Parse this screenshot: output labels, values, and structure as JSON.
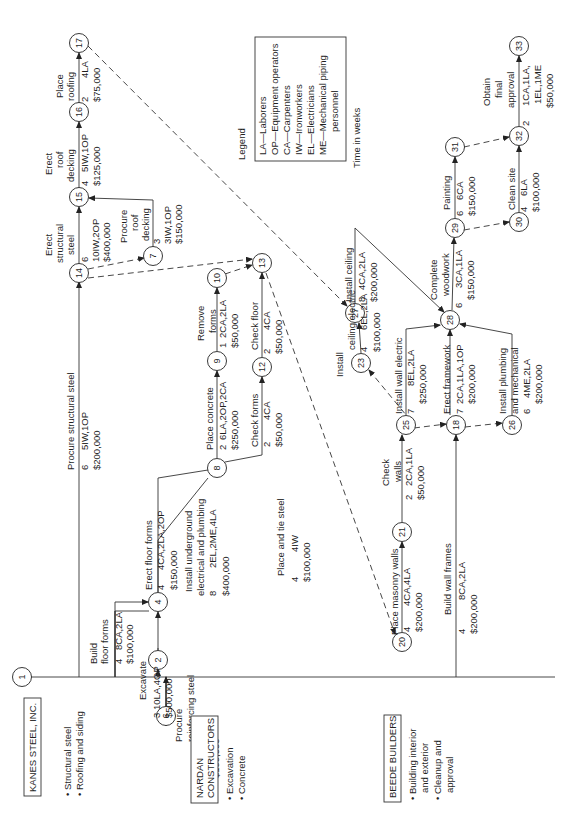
{
  "legend": {
    "title": "Legend",
    "items": [
      "LA—Laborers",
      "OP—Equipment operators",
      "CA—Carpenters",
      "IW—Ironworkers",
      "EL—Electricians",
      "ME—Mechanical piping",
      "personnel"
    ],
    "time_note": "Time in weeks"
  },
  "contractors": [
    {
      "name": "KANES STEEL, INC.",
      "scope": [
        "• Structural steel",
        "• Roofing and siding"
      ]
    },
    {
      "name": "NARDAN",
      "name2": "CONSTRUCTORS",
      "scope": [
        "• Excavation",
        "• Concrete"
      ]
    },
    {
      "name": "BEEDE BUILDERS",
      "scope": [
        "• Building interior",
        "and exterior",
        "• Cleanup and",
        "approval"
      ]
    }
  ],
  "nodes": [
    "1",
    "2",
    "4",
    "6",
    "7",
    "8",
    "9",
    "10",
    "12",
    "13",
    "14",
    "15",
    "16",
    "17",
    "18",
    "20",
    "21",
    "23",
    "25",
    "26",
    "27",
    "28",
    "29",
    "30",
    "31",
    "32",
    "33"
  ],
  "activities": {
    "procure_structural_steel": {
      "name": "Procure structural steel",
      "duration": "6",
      "resources": "5IW,1OP",
      "cost": "$200,000"
    },
    "erect_structural_steel": {
      "name1": "Erect",
      "name2": "structural",
      "name3": "steel",
      "duration": "6",
      "resources": "10IW,2OP",
      "cost": "$400,000"
    },
    "procure_roof_decking": {
      "name1": "Procure",
      "name2": "roof",
      "name3": "decking",
      "duration": "3",
      "resources": "3IW,1OP",
      "cost": "$150,000"
    },
    "erect_roof_decking": {
      "name1": "Erect",
      "name2": "roof",
      "name3": "decking",
      "duration": "4",
      "resources": "5IW,1OP",
      "cost": "$125,000"
    },
    "place_roofing": {
      "name1": "Place",
      "name2": "roofing",
      "duration": "2",
      "resources": "4LA",
      "cost": "$75,000"
    },
    "build_floor_forms": {
      "name1": "Build",
      "name2": "floor forms",
      "duration": "4",
      "resources": "8CA,2LA",
      "cost": "$100,000"
    },
    "excavate": {
      "name": "Excavate",
      "duration": "3",
      "resources": "10LA,4OP",
      "cost": "$500,000"
    },
    "procure_reinforcing_steel": {
      "name1": "Procure",
      "name2": "reinforcing steel",
      "duration": "3",
      "resources": "2IW",
      "cost": "$100,000"
    },
    "erect_floor_forms": {
      "name": "Erect floor forms",
      "duration": "4",
      "resources": "4CA,2LA,2OP",
      "cost": "$150,000"
    },
    "install_underground": {
      "name1": "Install underground",
      "name2": "electrical and plumbing",
      "duration": "8",
      "resources": "2EL,2ME,4LA",
      "cost": "$400,000"
    },
    "place_and_tie_steel": {
      "name": "Place and tie steel",
      "duration": "4",
      "resources": "4IW",
      "cost": "$100,000"
    },
    "place_concrete": {
      "name": "Place concrete",
      "duration": "2",
      "resources": "6LA,2OP,2CA",
      "cost": "$250,000"
    },
    "remove_forms": {
      "name1": "Remove",
      "name2": "forms",
      "duration": "1",
      "resources": "2CA,2LA",
      "cost": "$50,000"
    },
    "check_forms": {
      "name": "Check forms",
      "duration": "2",
      "resources": "4CA",
      "cost": "$50,000"
    },
    "check_floor": {
      "name": "Check floor",
      "duration": "2",
      "resources": "4CA",
      "cost": "$50,000"
    },
    "place_masonry_walls": {
      "name": "Place masonry walls",
      "duration": "4",
      "resources": "4CA,4LA",
      "cost": "$200,000"
    },
    "check_walls": {
      "name1": "Check",
      "name2": "walls",
      "duration": "2",
      "resources": "2CA,1LA",
      "cost": "$50,000"
    },
    "build_wall_frames": {
      "name": "Build wall frames",
      "duration": "4",
      "resources": "8CA,2LA",
      "cost": "$200,000"
    },
    "install_ceiling_electric": {
      "name1": "Install",
      "name2": "ceiling electric",
      "duration": "4",
      "resources": "6EL,2LA",
      "cost": "$100,000"
    },
    "install_ceiling": {
      "name": "Install ceiling",
      "duration": "8",
      "resources": "4CA,2LA",
      "cost": "$200,000"
    },
    "install_wall_electric": {
      "name": "Install wall electric",
      "duration": "7",
      "resources": "8EL,2LA",
      "cost": "$250,000"
    },
    "erect_framework": {
      "name": "Erect framework",
      "duration": "7",
      "resources": "2CA,1LA,1OP",
      "cost": "$200,000"
    },
    "install_plumbing": {
      "name1": "Install plumbing",
      "name2": "and mechanical",
      "duration": "6",
      "resources": "4ME,2LA",
      "cost": "$200,000"
    },
    "complete_woodwork": {
      "name1": "Complete",
      "name2": "woodwork",
      "duration": "6",
      "resources": "3CA,1LA",
      "cost": "$150,000"
    },
    "painting": {
      "name": "Painting",
      "duration": "6",
      "resources": "6CA",
      "cost": "$150,000"
    },
    "clean_site": {
      "name": "Clean site",
      "duration": "4",
      "resources": "6LA",
      "cost": "$100,000"
    },
    "obtain_final_approval": {
      "name1": "Obtain",
      "name2": "final",
      "name3": "approval",
      "duration": "2",
      "resources1": "1CA,1LA,",
      "resources2": "1EL,1ME",
      "cost": "$50,000"
    }
  }
}
